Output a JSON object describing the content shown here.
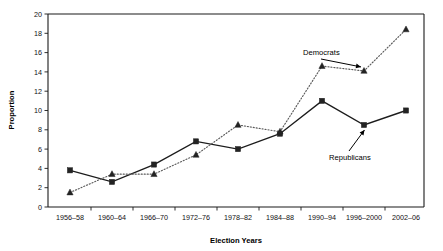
{
  "chart_data": {
    "type": "line",
    "title": "",
    "xlabel": "Election Years",
    "ylabel": "Proportion",
    "categories": [
      "1956–58",
      "1960–64",
      "1966–70",
      "1972–76",
      "1978–82",
      "1984–88",
      "1990–94",
      "1996–2000",
      "2002–06"
    ],
    "series": [
      {
        "name": "Republicans",
        "marker": "square",
        "linestyle": "solid",
        "color": "#232323",
        "values": [
          3.8,
          2.6,
          4.4,
          6.8,
          6.0,
          7.6,
          11.0,
          8.5,
          10.0
        ]
      },
      {
        "name": "Democrats",
        "marker": "triangle",
        "linestyle": "dotted",
        "color": "#232323",
        "values": [
          1.5,
          3.4,
          3.4,
          5.4,
          8.5,
          7.8,
          14.6,
          14.1,
          18.4
        ]
      }
    ],
    "ylim": [
      0,
      20
    ],
    "ytick_values": [
      0,
      2,
      4,
      6,
      8,
      10,
      12,
      14,
      16,
      18,
      20
    ],
    "ytick_labels": [
      "0",
      "2",
      "4",
      "6",
      "8",
      "10",
      "12",
      "14",
      "16",
      "18",
      "20"
    ],
    "grid": false,
    "legend_position": "inline-annotations",
    "annotations": [
      {
        "text": "Democrats",
        "points_to_series": "Democrats",
        "points_to_category": "1996–2000"
      },
      {
        "text": "Republicans",
        "points_to_series": "Republicans",
        "points_to_category": "1996–2000"
      }
    ]
  }
}
